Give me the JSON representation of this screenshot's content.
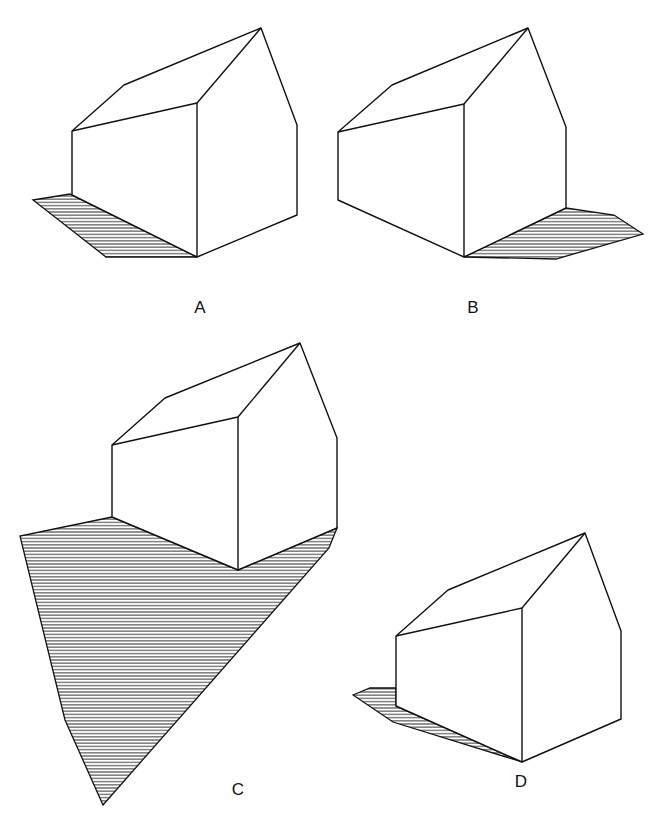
{
  "figure": {
    "panels": [
      {
        "id": "A",
        "label": "A",
        "label_pos": [
          200,
          308
        ],
        "apex": [
          261,
          28
        ],
        "right_eave": [
          297,
          125
        ],
        "right_bottom": [
          297,
          215
        ],
        "front_top": [
          197,
          103
        ],
        "front_bottom": [
          197,
          257
        ],
        "left_top": [
          72,
          131
        ],
        "left_bottom": [
          72,
          195
        ],
        "back_roof": [
          124,
          85
        ],
        "shadow": [
          [
            33,
            200
          ],
          [
            70,
            194
          ],
          [
            72,
            195
          ],
          [
            197,
            257
          ],
          [
            106,
            257
          ]
        ]
      },
      {
        "id": "B",
        "label": "B",
        "label_pos": [
          473,
          308
        ],
        "apex": [
          528,
          28
        ],
        "right_eave": [
          566,
          127
        ],
        "right_bottom": [
          566,
          208
        ],
        "front_top": [
          464,
          104
        ],
        "front_bottom": [
          464,
          257
        ],
        "left_top": [
          338,
          132
        ],
        "left_bottom": [
          338,
          200
        ],
        "back_roof": [
          392,
          85
        ],
        "shadow": [
          [
            464,
            257
          ],
          [
            566,
            208
          ],
          [
            614,
            215
          ],
          [
            643,
            234
          ],
          [
            556,
            259
          ]
        ]
      },
      {
        "id": "C",
        "label": "C",
        "label_pos": [
          238,
          790
        ],
        "apex": [
          300,
          343
        ],
        "right_eave": [
          337,
          438
        ],
        "right_bottom": [
          337,
          528
        ],
        "front_top": [
          238,
          417
        ],
        "front_bottom": [
          238,
          570
        ],
        "left_top": [
          112,
          445
        ],
        "left_bottom": [
          112,
          517
        ],
        "back_roof": [
          165,
          398
        ],
        "shadow": [
          [
            112,
            517
          ],
          [
            20,
            536
          ],
          [
            65,
            720
          ],
          [
            103,
            805
          ],
          [
            329,
            548
          ],
          [
            337,
            528
          ],
          [
            238,
            570
          ]
        ]
      },
      {
        "id": "D",
        "label": "D",
        "label_pos": [
          521,
          782
        ],
        "apex": [
          585,
          533
        ],
        "right_eave": [
          621,
          631
        ],
        "right_bottom": [
          621,
          719
        ],
        "front_top": [
          522,
          608
        ],
        "front_bottom": [
          522,
          762
        ],
        "left_top": [
          396,
          636
        ],
        "left_bottom": [
          396,
          706
        ],
        "back_roof": [
          448,
          590
        ],
        "shadow": [
          [
            353,
            695
          ],
          [
            370,
            688
          ],
          [
            396,
            688
          ],
          [
            396,
            706
          ],
          [
            522,
            762
          ],
          [
            393,
            722
          ]
        ]
      }
    ],
    "colors": {
      "line": "#111111",
      "hatch": "#222222",
      "background": "#ffffff"
    }
  }
}
